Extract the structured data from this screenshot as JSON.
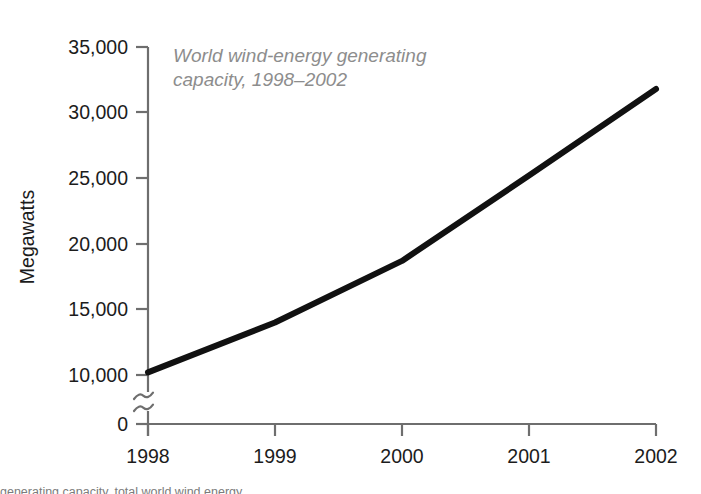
{
  "figure": {
    "background_color": "#ffffff",
    "line_color": "#111111",
    "axis_color": "#6e6e6e",
    "title_color": "#8d8d8d",
    "tick_text_color": "#1c1c1c",
    "caption_cropped": "generating capacity, total world wind energy"
  },
  "chart_data": {
    "type": "line",
    "title": "World wind-energy generating capacity, 1998–2002",
    "title_line_1": "World wind-energy generating",
    "title_line_2": "capacity, 1998–2002",
    "xlabel": "",
    "ylabel": "Megawatts",
    "x": [
      1998,
      1999,
      2000,
      2001,
      2002
    ],
    "categories": [
      "1998",
      "1999",
      "2000",
      "2001",
      "2002"
    ],
    "values": [
      10200,
      14000,
      18700,
      25200,
      31800
    ],
    "series": [
      {
        "name": "World wind-energy generating capacity",
        "values": [
          10200,
          14000,
          18700,
          25200,
          31800
        ]
      }
    ],
    "ylim": [
      0,
      35000
    ],
    "axis_break": true,
    "axis_break_between": [
      0,
      10000
    ],
    "axis_break_symbol": "≈",
    "ytick_values": [
      0,
      10000,
      15000,
      20000,
      25000,
      30000,
      35000
    ],
    "ytick_labels": [
      "0",
      "10,000",
      "15,000",
      "20,000",
      "25,000",
      "30,000",
      "35,000"
    ],
    "xtick_labels": [
      "1998",
      "1999",
      "2000",
      "2001",
      "2002"
    ],
    "grid": false,
    "legend": false,
    "legend_position": "none"
  }
}
